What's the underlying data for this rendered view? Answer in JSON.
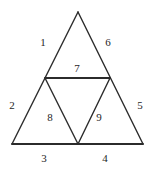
{
  "figure": {
    "background_color": "#ffffff",
    "stroke_color": "#2b2b2b",
    "label_color": "#262626",
    "outer_triangle": {
      "apex": {
        "x": 78,
        "y": 12
      },
      "bottom_left": {
        "x": 12,
        "y": 144
      },
      "bottom_right": {
        "x": 143,
        "y": 144
      }
    },
    "inner_triangle": {
      "left_midpoint": {
        "x": 45,
        "y": 78
      },
      "right_midpoint": {
        "x": 110,
        "y": 78
      },
      "base_midpoint": {
        "x": 78,
        "y": 144
      }
    },
    "labels": [
      {
        "id": "label-1",
        "text": "1",
        "x": 43,
        "y": 42
      },
      {
        "id": "label-2",
        "text": "2",
        "x": 12,
        "y": 105
      },
      {
        "id": "label-3",
        "text": "3",
        "x": 44,
        "y": 158
      },
      {
        "id": "label-4",
        "text": "4",
        "x": 105,
        "y": 158
      },
      {
        "id": "label-5",
        "text": "5",
        "x": 140,
        "y": 105
      },
      {
        "id": "label-6",
        "text": "6",
        "x": 108,
        "y": 42
      },
      {
        "id": "label-7",
        "text": "7",
        "x": 77,
        "y": 68
      },
      {
        "id": "label-8",
        "text": "8",
        "x": 50,
        "y": 117
      },
      {
        "id": "label-9",
        "text": "9",
        "x": 99,
        "y": 117
      }
    ]
  }
}
